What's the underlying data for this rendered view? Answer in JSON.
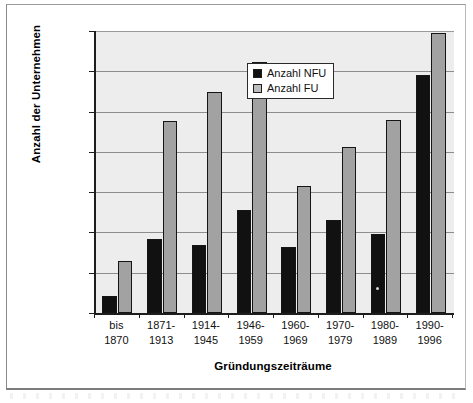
{
  "chart_data": {
    "type": "bar",
    "title": "",
    "xlabel": "Gründungszeiträume",
    "ylabel": "Anzahl der Unternehmen",
    "ylim": [
      0,
      35000
    ],
    "yticks": [
      "0",
      "5.000",
      "10.000",
      "15.000",
      "20.000",
      "25.000",
      "30.000",
      "35.000"
    ],
    "ytick_values": [
      0,
      5000,
      10000,
      15000,
      20000,
      25000,
      30000,
      35000
    ],
    "grid": "horizontal",
    "legend_position": "inside-top-center",
    "categories": [
      "bis\n1870",
      "1871-\n1913",
      "1914-\n1945",
      "1946-\n1959",
      "1960-\n1969",
      "1970-\n1979",
      "1980-\n1989",
      "1990-\n1996"
    ],
    "category_lines": [
      [
        "bis",
        "1870"
      ],
      [
        "1871-",
        "1913"
      ],
      [
        "1914-",
        "1945"
      ],
      [
        "1946-",
        "1959"
      ],
      [
        "1960-",
        "1969"
      ],
      [
        "1970-",
        "1979"
      ],
      [
        "1980-",
        "1989"
      ],
      [
        "1990-",
        "1996"
      ]
    ],
    "series": [
      {
        "name": "Anzahl NFU",
        "color": "#111111",
        "values": [
          2100,
          9200,
          8400,
          12800,
          8200,
          11500,
          9800,
          29500
        ]
      },
      {
        "name": "Anzahl FU",
        "color": "#a2a2a2",
        "values": [
          6400,
          23800,
          27400,
          31100,
          15800,
          20600,
          23900,
          34800
        ]
      }
    ]
  },
  "legend": {
    "items": [
      {
        "label": "Anzahl NFU"
      },
      {
        "label": "Anzahl FU"
      }
    ]
  },
  "colors": {
    "nfu": "#111111",
    "fu": "#a2a2a2",
    "plot_background": "#ededed",
    "gridline": "#8d8d8d",
    "axis": "#1d1d1d"
  }
}
